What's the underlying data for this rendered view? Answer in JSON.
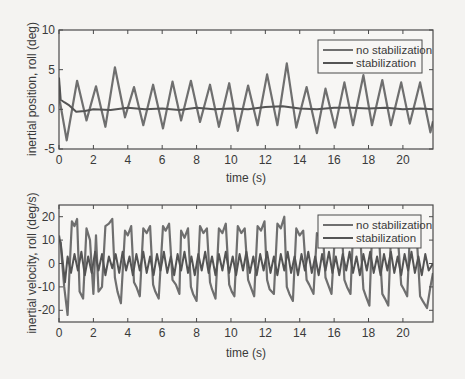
{
  "colors": {
    "background": "#f4f3f1",
    "plot_background": "#f7f6f4",
    "axis": "#4a4a4a",
    "no_stabilization": "#6f6f6f",
    "stabilization": "#545454"
  },
  "chart_data": [
    {
      "type": "line",
      "title": "",
      "xlabel": "time (s)",
      "ylabel": "inertial position, roll (deg)",
      "xlim": [
        0,
        21.75
      ],
      "ylim": [
        -5,
        10
      ],
      "xticks": [
        0,
        2,
        4,
        6,
        8,
        10,
        12,
        14,
        16,
        18,
        20
      ],
      "yticks": [
        -5,
        0,
        5,
        10
      ],
      "grid": false,
      "legend_position": "upper right",
      "legend": [
        "no stabilization",
        "stabilization"
      ],
      "series": [
        {
          "name": "no stabilization",
          "x": [
            0,
            0.05,
            0.45,
            1.05,
            1.6,
            2.15,
            2.7,
            3.25,
            3.84,
            4.36,
            4.9,
            5.47,
            6.05,
            6.6,
            7.1,
            7.67,
            8.2,
            8.78,
            9.3,
            9.9,
            10.4,
            11.0,
            11.55,
            12.1,
            12.7,
            13.25,
            13.8,
            14.4,
            15.0,
            15.5,
            16.05,
            16.6,
            17.1,
            17.7,
            18.2,
            18.8,
            19.3,
            19.9,
            20.4,
            21.0,
            21.6,
            21.75
          ],
          "y": [
            3.0,
            1.0,
            -3.9,
            3.6,
            -1.4,
            2.9,
            -2.2,
            5.3,
            -1.0,
            2.8,
            -2.0,
            3.1,
            -2.4,
            3.5,
            -1.4,
            3.6,
            -1.6,
            3.1,
            -2.2,
            3.3,
            -2.7,
            3.0,
            -2.0,
            4.4,
            -2.0,
            5.8,
            -2.3,
            2.8,
            -3.0,
            2.6,
            -2.3,
            3.4,
            -2.0,
            4.3,
            -2.0,
            3.7,
            -2.0,
            3.4,
            -1.8,
            3.4,
            -2.9,
            -1.5
          ]
        },
        {
          "name": "stabilization",
          "x": [
            0,
            0.1,
            0.3,
            0.6,
            1.0,
            1.5,
            2.0,
            3.0,
            4.0,
            5.0,
            6.0,
            7.0,
            8.0,
            9.0,
            10.0,
            11.0,
            12.0,
            13.0,
            14.0,
            15.0,
            16.0,
            17.0,
            18.0,
            19.0,
            20.0,
            21.0,
            21.75
          ],
          "y": [
            4.0,
            1.2,
            0.9,
            0.5,
            -0.3,
            -0.2,
            0.0,
            -0.1,
            0.2,
            0.0,
            0.1,
            -0.1,
            0.2,
            0.0,
            0.1,
            0.0,
            0.3,
            0.4,
            0.1,
            0.0,
            0.2,
            0.2,
            0.1,
            0.2,
            0.0,
            0.1,
            0.0
          ]
        }
      ]
    },
    {
      "type": "line",
      "title": "",
      "xlabel": "time (s)",
      "ylabel": "inertial velocity, roll (deg/s)",
      "xlim": [
        0,
        21.75
      ],
      "ylim": [
        -25,
        25
      ],
      "xticks": [
        0,
        2,
        4,
        6,
        8,
        10,
        12,
        14,
        16,
        18,
        20
      ],
      "yticks": [
        -20,
        -10,
        0,
        10,
        20
      ],
      "grid": false,
      "legend_position": "upper right",
      "legend": [
        "no stabilization",
        "stabilization"
      ],
      "series": [
        {
          "name": "no stabilization",
          "x": [
            0,
            0.1,
            0.3,
            0.5,
            0.6,
            0.75,
            0.9,
            1.05,
            1.2,
            1.4,
            1.6,
            1.8,
            2.0,
            2.15,
            2.3,
            2.5,
            2.7,
            2.9,
            3.1,
            3.25,
            3.4,
            3.6,
            3.84,
            4.0,
            4.2,
            4.36,
            4.5,
            4.7,
            4.9,
            5.1,
            5.3,
            5.47,
            5.6,
            5.8,
            6.05,
            6.2,
            6.4,
            6.6,
            6.8,
            7.0,
            7.1,
            7.3,
            7.5,
            7.67,
            7.8,
            8.0,
            8.2,
            8.4,
            8.6,
            8.78,
            8.9,
            9.1,
            9.3,
            9.5,
            9.7,
            9.9,
            10.05,
            10.2,
            10.4,
            10.6,
            10.8,
            11.0,
            11.15,
            11.35,
            11.55,
            11.75,
            11.95,
            12.1,
            12.25,
            12.5,
            12.7,
            12.9,
            13.1,
            13.25,
            13.4,
            13.6,
            13.8,
            14.0,
            14.2,
            14.4,
            14.55,
            14.8,
            15.0,
            15.2,
            15.35,
            15.5,
            15.65,
            15.85,
            16.05,
            16.25,
            16.45,
            16.6,
            16.75,
            16.95,
            17.1,
            17.3,
            17.5,
            17.7,
            17.85,
            18.05,
            18.2,
            18.4,
            18.6,
            18.8,
            18.95,
            19.15,
            19.3,
            19.5,
            19.7,
            19.9,
            20.05,
            20.25,
            20.4,
            20.6,
            20.8,
            21.0,
            21.15,
            21.4,
            21.6,
            21.75
          ],
          "y": [
            12,
            8,
            -10,
            -22,
            -5,
            18,
            16,
            19,
            -12,
            -15,
            15,
            10,
            -13,
            12,
            -12,
            -10,
            16,
            17,
            19,
            -6,
            -12,
            -17,
            14,
            12,
            16,
            -8,
            -10,
            -14,
            15,
            13,
            16,
            -9,
            -12,
            -15,
            16,
            14,
            17,
            -7,
            -9,
            -13,
            14,
            11,
            15,
            -10,
            -13,
            -16,
            16,
            13,
            15,
            -8,
            -11,
            -15,
            15,
            13,
            17,
            -9,
            -12,
            -14,
            16,
            13,
            15,
            -7,
            -10,
            -14,
            16,
            14,
            18,
            -7,
            -11,
            -13,
            17,
            15,
            20,
            -10,
            -13,
            -16,
            15,
            12,
            14,
            -7,
            -9,
            -13,
            13,
            11,
            13,
            -6,
            -9,
            -13,
            13,
            11,
            14,
            -7,
            -10,
            -13,
            13,
            12,
            14,
            -11,
            -14,
            -18,
            12,
            10,
            13,
            -13,
            -15,
            -18,
            11,
            10,
            12,
            -9,
            -11,
            -14,
            12,
            10,
            12,
            -14,
            -16,
            -19,
            -10,
            -4
          ]
        },
        {
          "name": "stabilization",
          "x": [
            0,
            0.1,
            0.2,
            0.35,
            0.5,
            0.7,
            0.9,
            1.1,
            1.3,
            1.5,
            1.7,
            1.9,
            2.1,
            2.3,
            2.5,
            2.7,
            2.9,
            3.1,
            3.3,
            3.5,
            3.7,
            3.9,
            4.1,
            4.3,
            4.5,
            4.7,
            4.9,
            5.1,
            5.3,
            5.5,
            5.7,
            5.9,
            6.1,
            6.3,
            6.5,
            6.7,
            6.9,
            7.1,
            7.3,
            7.5,
            7.7,
            7.9,
            8.1,
            8.3,
            8.5,
            8.7,
            8.9,
            9.1,
            9.3,
            9.5,
            9.7,
            9.9,
            10.1,
            10.3,
            10.5,
            10.7,
            10.9,
            11.1,
            11.3,
            11.5,
            11.7,
            11.9,
            12.1,
            12.3,
            12.5,
            12.7,
            12.9,
            13.1,
            13.3,
            13.5,
            13.7,
            13.9,
            14.1,
            14.3,
            14.5,
            14.7,
            14.9,
            15.1,
            15.3,
            15.5,
            15.7,
            15.9,
            16.1,
            16.3,
            16.5,
            16.7,
            16.9,
            17.1,
            17.3,
            17.5,
            17.7,
            17.9,
            18.1,
            18.3,
            18.5,
            18.7,
            18.9,
            19.1,
            19.3,
            19.5,
            19.7,
            19.9,
            20.1,
            20.3,
            20.5,
            20.7,
            20.9,
            21.1,
            21.3,
            21.5,
            21.75
          ],
          "y": [
            10,
            9,
            2,
            -8,
            3,
            -4,
            4,
            -3,
            5,
            -5,
            3,
            -4,
            5,
            -3,
            4,
            -5,
            3,
            -2,
            4,
            -4,
            5,
            -3,
            3,
            -5,
            4,
            -3,
            5,
            -4,
            3,
            -5,
            4,
            -3,
            5,
            -4,
            3,
            -5,
            4,
            -3,
            5,
            -4,
            3,
            -5,
            4,
            -3,
            5,
            -4,
            3,
            -5,
            4,
            -3,
            5,
            -4,
            3,
            -5,
            4,
            -3,
            5,
            -4,
            3,
            -5,
            4,
            -3,
            5,
            -4,
            3,
            -5,
            4,
            -3,
            5,
            -4,
            3,
            -5,
            4,
            -3,
            5,
            -4,
            3,
            -5,
            4,
            -3,
            5,
            -4,
            3,
            -5,
            4,
            -3,
            5,
            -4,
            3,
            -5,
            4,
            -3,
            5,
            -4,
            3,
            -5,
            4,
            -3,
            5,
            -4,
            3,
            -5,
            4,
            -3,
            5,
            -4,
            3,
            -5,
            4,
            -3,
            0
          ]
        }
      ]
    }
  ],
  "plots": [
    {
      "box": {
        "x": 59,
        "y": 30,
        "w": 374,
        "h": 119
      },
      "legend_box": {
        "x": 318,
        "y": 40,
        "w": 104,
        "h": 33
      },
      "xlabel_pos": {
        "x": 246,
        "y": 182
      },
      "ylabel_pos": {
        "x": 36,
        "y": 89
      }
    },
    {
      "box": {
        "x": 59,
        "y": 205,
        "w": 374,
        "h": 117
      },
      "legend_box": {
        "x": 318,
        "y": 215,
        "w": 103,
        "h": 33
      },
      "xlabel_pos": {
        "x": 246,
        "y": 357
      },
      "ylabel_pos": {
        "x": 36,
        "y": 263
      }
    }
  ]
}
